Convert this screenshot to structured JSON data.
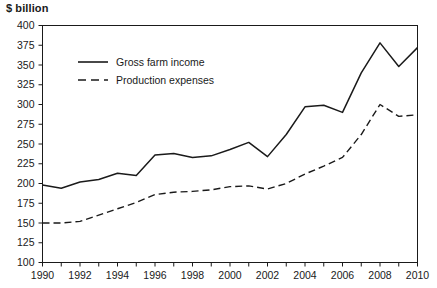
{
  "chart_data": {
    "type": "line",
    "title": "",
    "unit_label": "$ billion",
    "xlabel": "",
    "ylabel": "$ billion",
    "x": [
      1990,
      1991,
      1992,
      1993,
      1994,
      1995,
      1996,
      1997,
      1998,
      1999,
      2000,
      2001,
      2002,
      2003,
      2004,
      2005,
      2006,
      2007,
      2008,
      2009,
      2010
    ],
    "categories": [
      "1990",
      "1991",
      "1992",
      "1993",
      "1994",
      "1995",
      "1996",
      "1997",
      "1998",
      "1999",
      "2000",
      "2001",
      "2002",
      "2003",
      "2004",
      "2005",
      "2006",
      "2007",
      "2008",
      "2009",
      "2010"
    ],
    "xlim": [
      1990,
      2010
    ],
    "ylim": [
      100,
      400
    ],
    "y_ticks": [
      100,
      125,
      150,
      175,
      200,
      225,
      250,
      275,
      300,
      325,
      350,
      375,
      400
    ],
    "y_tick_labels": [
      "100",
      "125",
      "150",
      "175",
      "200",
      "225",
      "250",
      "275",
      "300",
      "325",
      "350",
      "375",
      "400"
    ],
    "x_tick_labels": [
      "1990",
      "1992",
      "1994",
      "1996",
      "1998",
      "2000",
      "2002",
      "2004",
      "2006",
      "2008",
      "2010"
    ],
    "x_tick_label_values": [
      1990,
      1992,
      1994,
      1996,
      1998,
      2000,
      2002,
      2004,
      2006,
      2008,
      2010
    ],
    "x_minor_ticks": [
      1990,
      1991,
      1992,
      1993,
      1994,
      1995,
      1996,
      1997,
      1998,
      1999,
      2000,
      2001,
      2002,
      2003,
      2004,
      2005,
      2006,
      2007,
      2008,
      2009,
      2010
    ],
    "grid": false,
    "legend_position": "upper-left-inside",
    "series": [
      {
        "name": "Gross farm income",
        "style": "solid",
        "color": "#1a1a1a",
        "values": [
          198,
          194,
          202,
          205,
          213,
          210,
          236,
          238,
          233,
          235,
          243,
          252,
          234,
          262,
          297,
          299,
          290,
          340,
          378,
          348,
          372
        ]
      },
      {
        "name": "Production expenses",
        "style": "dashed",
        "color": "#1a1a1a",
        "values": [
          150,
          150,
          152,
          160,
          168,
          176,
          186,
          189,
          190,
          192,
          196,
          197,
          193,
          200,
          212,
          222,
          233,
          262,
          300,
          285,
          287
        ]
      }
    ]
  }
}
